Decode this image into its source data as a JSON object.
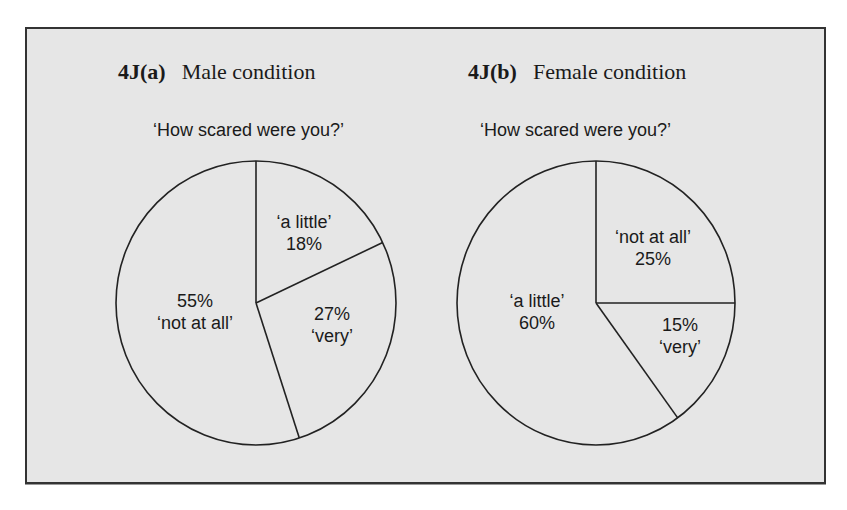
{
  "figure": {
    "frame": {
      "background": "#e6e6e6",
      "border": "#333333"
    }
  },
  "chart_data": [
    {
      "type": "pie",
      "id": "4J(a)",
      "figure_label": "4J(a)",
      "title": "Male condition",
      "subtitle": "‘How scared were you?’",
      "slices": [
        {
          "label": "‘a little’",
          "value": 18,
          "value_text": "18%",
          "order": "label-first"
        },
        {
          "label": "‘very’",
          "value": 27,
          "value_text": "27%",
          "order": "value-first"
        },
        {
          "label": "‘not at all’",
          "value": 55,
          "value_text": "55%",
          "order": "value-first"
        }
      ],
      "start_angle": "12 o'clock",
      "direction": "clockwise",
      "fill": "#e6e6e6",
      "stroke": "#222222"
    },
    {
      "type": "pie",
      "id": "4J(b)",
      "figure_label": "4J(b)",
      "title": "Female condition",
      "subtitle": "‘How scared were you?’",
      "slices": [
        {
          "label": "‘not at all’",
          "value": 25,
          "value_text": "25%",
          "order": "label-first"
        },
        {
          "label": "‘very’",
          "value": 15,
          "value_text": "15%",
          "order": "value-first"
        },
        {
          "label": "‘a little’",
          "value": 60,
          "value_text": "60%",
          "order": "label-first"
        }
      ],
      "start_angle": "12 o'clock",
      "direction": "clockwise",
      "fill": "#e6e6e6",
      "stroke": "#222222"
    }
  ]
}
